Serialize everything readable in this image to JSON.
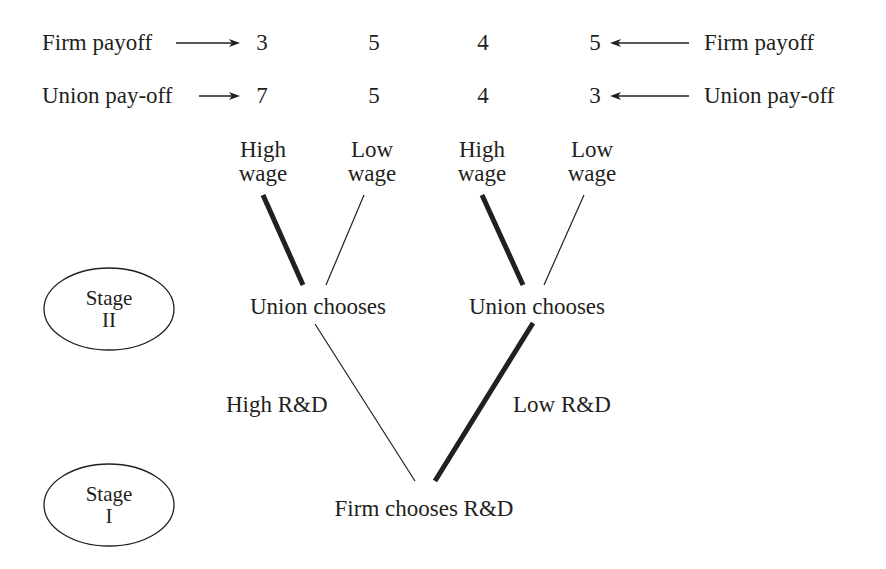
{
  "payoff_rows": {
    "firm": {
      "left_label": "Firm payoff",
      "right_label": "Firm payoff",
      "values": [
        "3",
        "5",
        "4",
        "5"
      ]
    },
    "union": {
      "left_label": "Union pay-off",
      "right_label": "Union pay-off",
      "values": [
        "7",
        "5",
        "4",
        "3"
      ]
    }
  },
  "stage2": {
    "label_line1": "Stage",
    "label_line2": "II",
    "nodes": [
      {
        "label": "Union chooses",
        "branches": [
          {
            "line1": "High",
            "line2": "wage",
            "equilibrium": true
          },
          {
            "line1": "Low",
            "line2": "wage",
            "equilibrium": false
          }
        ]
      },
      {
        "label": "Union chooses",
        "branches": [
          {
            "line1": "High",
            "line2": "wage",
            "equilibrium": true
          },
          {
            "line1": "Low",
            "line2": "wage",
            "equilibrium": false
          }
        ]
      }
    ]
  },
  "stage1": {
    "label_line1": "Stage",
    "label_line2": "I",
    "node_label": "Firm chooses R&D",
    "branches": [
      {
        "label": "High R&D",
        "equilibrium": false
      },
      {
        "label": "Low R&D",
        "equilibrium": true
      }
    ]
  },
  "colors": {
    "ink": "#231f20",
    "background": "#ffffff"
  }
}
